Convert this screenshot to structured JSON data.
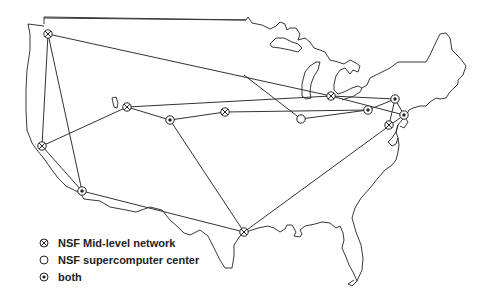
{
  "map": {
    "title": "NSFNET backbone map",
    "colors": {
      "line": "#333333",
      "coast": "#222222",
      "background": "#ffffff"
    },
    "nodes": [
      {
        "id": "seattle",
        "type": "mid-level",
        "x": 48,
        "y": 34
      },
      {
        "id": "palo-alto",
        "type": "mid-level",
        "x": 42,
        "y": 146
      },
      {
        "id": "san-diego",
        "type": "both",
        "x": 82,
        "y": 191
      },
      {
        "id": "salt-lake",
        "type": "mid-level",
        "x": 127,
        "y": 107
      },
      {
        "id": "boulder",
        "type": "both",
        "x": 170,
        "y": 120
      },
      {
        "id": "lincoln",
        "type": "mid-level",
        "x": 225,
        "y": 112
      },
      {
        "id": "champaign",
        "type": "supercomputer",
        "x": 301,
        "y": 119
      },
      {
        "id": "ann-arbor",
        "type": "mid-level",
        "x": 331,
        "y": 96
      },
      {
        "id": "pittsburgh",
        "type": "both",
        "x": 368,
        "y": 110
      },
      {
        "id": "ithaca",
        "type": "both",
        "x": 395,
        "y": 99
      },
      {
        "id": "princeton",
        "type": "both",
        "x": 404,
        "y": 115
      },
      {
        "id": "college-park",
        "type": "mid-level",
        "x": 389,
        "y": 125
      },
      {
        "id": "houston",
        "type": "mid-level",
        "x": 244,
        "y": 232
      }
    ]
  },
  "legend": {
    "items": [
      {
        "symbol": "mid-level",
        "label": "NSF Mid-level network"
      },
      {
        "symbol": "supercomputer",
        "label": "NSF supercomputer center"
      },
      {
        "symbol": "both",
        "label": "both"
      }
    ]
  }
}
